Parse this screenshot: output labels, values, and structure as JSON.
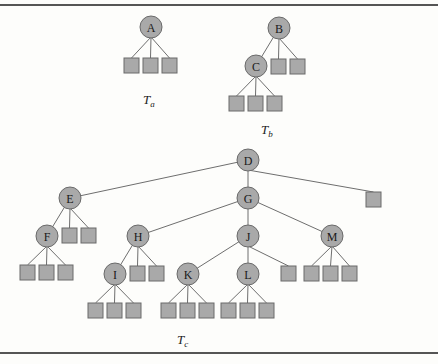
{
  "figure": {
    "trees": [
      {
        "name": "T_a",
        "label_main": "T",
        "label_sub": "a",
        "label_pos": [
          143,
          104
        ],
        "nodes": [
          {
            "id": "A",
            "label": "A",
            "x": 151,
            "y": 27
          }
        ],
        "leaves": [
          {
            "x": 124,
            "y": 58,
            "parent": "A"
          },
          {
            "x": 143,
            "y": 58,
            "parent": "A"
          },
          {
            "x": 162,
            "y": 58,
            "parent": "A"
          }
        ],
        "edges": []
      },
      {
        "name": "T_b",
        "label_main": "T",
        "label_sub": "b",
        "label_pos": [
          261,
          134
        ],
        "nodes": [
          {
            "id": "B",
            "label": "B",
            "x": 279,
            "y": 28
          },
          {
            "id": "C",
            "label": "C",
            "x": 256,
            "y": 66
          }
        ],
        "leaves": [
          {
            "x": 271,
            "y": 59,
            "parent": "B"
          },
          {
            "x": 290,
            "y": 59,
            "parent": "B"
          },
          {
            "x": 229,
            "y": 96,
            "parent": "C"
          },
          {
            "x": 248,
            "y": 96,
            "parent": "C"
          },
          {
            "x": 267,
            "y": 96,
            "parent": "C"
          }
        ],
        "edges": [
          [
            "B",
            "C"
          ]
        ]
      },
      {
        "name": "T_c",
        "label_main": "T",
        "label_sub": "c",
        "label_pos": [
          177,
          344
        ],
        "nodes": [
          {
            "id": "D",
            "label": "D",
            "x": 248,
            "y": 160
          },
          {
            "id": "E",
            "label": "E",
            "x": 70,
            "y": 198
          },
          {
            "id": "G",
            "label": "G",
            "x": 248,
            "y": 198
          },
          {
            "id": "F",
            "label": "F",
            "x": 47,
            "y": 236
          },
          {
            "id": "H",
            "label": "H",
            "x": 138,
            "y": 236
          },
          {
            "id": "J",
            "label": "J",
            "x": 248,
            "y": 236
          },
          {
            "id": "M",
            "label": "M",
            "x": 332,
            "y": 236
          },
          {
            "id": "I",
            "label": "I",
            "x": 115,
            "y": 274
          },
          {
            "id": "K",
            "label": "K",
            "x": 188,
            "y": 274
          },
          {
            "id": "L",
            "label": "L",
            "x": 248,
            "y": 274
          }
        ],
        "leaves": [
          {
            "x": 366,
            "y": 192,
            "parent": "D"
          },
          {
            "x": 62,
            "y": 228,
            "parent": "E"
          },
          {
            "x": 81,
            "y": 228,
            "parent": "E"
          },
          {
            "x": 20,
            "y": 265,
            "parent": "F"
          },
          {
            "x": 39,
            "y": 265,
            "parent": "F"
          },
          {
            "x": 58,
            "y": 265,
            "parent": "F"
          },
          {
            "x": 130,
            "y": 266,
            "parent": "H"
          },
          {
            "x": 149,
            "y": 266,
            "parent": "H"
          },
          {
            "x": 281,
            "y": 266,
            "parent": "J"
          },
          {
            "x": 304,
            "y": 266,
            "parent": "M"
          },
          {
            "x": 323,
            "y": 266,
            "parent": "M"
          },
          {
            "x": 342,
            "y": 266,
            "parent": "M"
          },
          {
            "x": 88,
            "y": 303,
            "parent": "I"
          },
          {
            "x": 107,
            "y": 303,
            "parent": "I"
          },
          {
            "x": 126,
            "y": 303,
            "parent": "I"
          },
          {
            "x": 161,
            "y": 303,
            "parent": "K"
          },
          {
            "x": 180,
            "y": 303,
            "parent": "K"
          },
          {
            "x": 199,
            "y": 303,
            "parent": "K"
          },
          {
            "x": 221,
            "y": 303,
            "parent": "L"
          },
          {
            "x": 240,
            "y": 303,
            "parent": "L"
          },
          {
            "x": 259,
            "y": 303,
            "parent": "L"
          }
        ],
        "edges": [
          [
            "D",
            "E"
          ],
          [
            "D",
            "G"
          ],
          [
            "E",
            "F"
          ],
          [
            "G",
            "H"
          ],
          [
            "G",
            "J"
          ],
          [
            "G",
            "M"
          ],
          [
            "H",
            "I"
          ],
          [
            "J",
            "K"
          ],
          [
            "J",
            "L"
          ]
        ]
      }
    ],
    "node_radius": 11,
    "leaf_size": 15,
    "colors": {
      "node_fill": "#a9a9a9",
      "stroke": "#6a6a6a",
      "edge": "#6e6e6e"
    }
  }
}
